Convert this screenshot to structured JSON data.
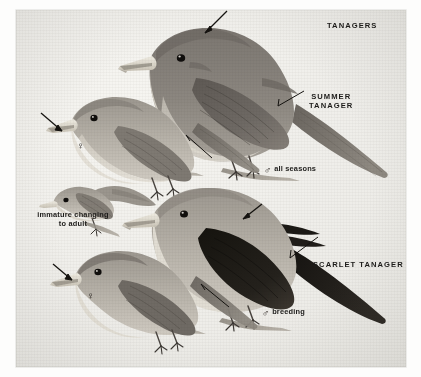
{
  "plate": {
    "title": "TANAGERS",
    "medium": "halftone field-guide illustration",
    "background_color": "#efeeea",
    "ink_color": "#1d1c1a"
  },
  "labels": {
    "title": "TANAGERS",
    "summer_tanager": "SUMMER\nTANAGER",
    "summer_tanager_line1": "SUMMER",
    "summer_tanager_line2": "TANAGER",
    "scarlet_tanager": "SCARLET TANAGER",
    "male_all_seasons": "all seasons",
    "male_breeding": "breeding",
    "immature_line1": "immature changing",
    "immature_line2": "to adult",
    "male_symbol": "♂",
    "female_symbol": "♀"
  },
  "figures": [
    {
      "id": "summer-tanager-male",
      "species": "Summer Tanager",
      "sex": "male",
      "plumage": "all seasons",
      "caption": "♂ all seasons",
      "label": "SUMMER TANAGER"
    },
    {
      "id": "summer-tanager-female",
      "species": "Summer Tanager",
      "sex": "female",
      "plumage": "adult",
      "caption": "♀",
      "label": ""
    },
    {
      "id": "immature-changing-to-adult",
      "species": "Summer Tanager",
      "sex": "",
      "plumage": "immature changing to adult",
      "caption": "immature changing to adult",
      "label": ""
    },
    {
      "id": "scarlet-tanager-male",
      "species": "Scarlet Tanager",
      "sex": "male",
      "plumage": "breeding",
      "caption": "♂ breeding",
      "label": "SCARLET TANAGER"
    },
    {
      "id": "scarlet-tanager-female",
      "species": "Scarlet Tanager",
      "sex": "female",
      "plumage": "adult",
      "caption": "♀",
      "label": ""
    }
  ],
  "pointers": [
    {
      "id": "arrow-summer-male-crown",
      "target": "crown / head shape"
    },
    {
      "id": "arrow-summer-female-bill",
      "target": "bill"
    },
    {
      "id": "arrow-scarlet-male-nape",
      "target": "nape"
    },
    {
      "id": "arrow-scarlet-female-bill",
      "target": "bill"
    },
    {
      "id": "leader-summer-tanager-wing",
      "target": "wing, label SUMMER TANAGER"
    },
    {
      "id": "leader-summer-female-wing",
      "target": "wing"
    },
    {
      "id": "leader-scarlet-tanager-wing",
      "target": "black wing, label SCARLET TANAGER"
    },
    {
      "id": "leader-scarlet-female-wing",
      "target": "wing"
    }
  ]
}
